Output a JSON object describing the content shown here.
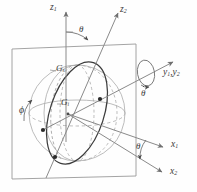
{
  "figure": {
    "background_color": "#fefefe",
    "line_color": "#7d7d7d",
    "dark_line_color": "#3c3c3c",
    "label_color": "#3a3a3a"
  },
  "axes": [
    {
      "id": "z1",
      "base": "z",
      "sub": "1",
      "label": "z₁",
      "role": "vertical-inertial-axis"
    },
    {
      "id": "z2",
      "base": "z",
      "sub": "2",
      "label": "z₂",
      "role": "tilted-body-axis"
    },
    {
      "id": "y12",
      "base": "y",
      "sub": "1",
      "base2": "y",
      "sub2": "2",
      "label": "y₁, y₂",
      "role": "line-of-nodes-axis"
    },
    {
      "id": "x1",
      "base": "x",
      "sub": "1",
      "label": "x₁",
      "role": "horizontal-inertial-axis"
    },
    {
      "id": "x2",
      "base": "x",
      "sub": "2",
      "label": "x₂",
      "role": "horizontal-body-axis"
    }
  ],
  "axis_labels": {
    "z1_base": "z",
    "z1_sub": "1",
    "z2_base": "z",
    "z2_sub": "2",
    "y_base_1": "y",
    "y_sub_1": "1",
    "y_comma": ",",
    "y_base_2": "y",
    "y_sub_2": "2",
    "x1_base": "x",
    "x1_sub": "1",
    "x2_base": "x",
    "x2_sub": "2"
  },
  "angles": [
    {
      "id": "theta-top",
      "symbol": "θ",
      "location": "between z1 and z2",
      "arc": true
    },
    {
      "id": "theta-bottom",
      "symbol": "θ",
      "location": "between x1 and x2",
      "arc": true
    },
    {
      "id": "theta-dot",
      "symbol": "θ",
      "accent": "dot",
      "location": "about y1,y2 rotation spiral",
      "arc": false
    },
    {
      "id": "phi",
      "symbol": "ϕ",
      "location": "left side of sphere",
      "arc": true
    }
  ],
  "angle_labels": {
    "theta_top": "θ",
    "theta_bottom": "θ",
    "theta_dot": "θ",
    "phi": "ϕ"
  },
  "curve_labels": {
    "gs_base": "G",
    "gs_sub": "s",
    "gi_base": "G",
    "gi_sub": "i"
  },
  "curves": [
    {
      "id": "Gs",
      "label": "Gₛ",
      "style": "dashed-light",
      "description": "outer meridian circle on sphere"
    },
    {
      "id": "Gi",
      "label": "Gᵢ",
      "style": "solid-dark",
      "description": "inclined great circle through sphere center"
    }
  ],
  "markers": [
    {
      "id": "point-upper-right",
      "on": "Gi",
      "style": "filled-dot"
    },
    {
      "id": "point-lower-left",
      "on": "Gi",
      "style": "filled-dot"
    },
    {
      "id": "point-bottom",
      "on": "Gi",
      "style": "filled-dot"
    }
  ],
  "shapes": {
    "frame": "square-plate",
    "sphere": "wireframe-sphere",
    "rotation_indicator": "spiral-arrow-about-y-axis"
  }
}
